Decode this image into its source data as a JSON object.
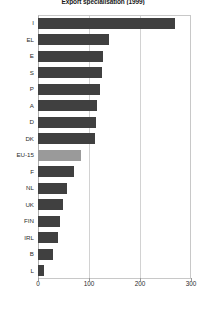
{
  "chart_data": {
    "type": "bar",
    "orientation": "horizontal",
    "title": "Export specialisation (1999)",
    "xlabel": "",
    "ylabel": "",
    "xlim": [
      0,
      300
    ],
    "xticks": [
      0,
      100,
      200,
      300
    ],
    "xtick_labels": [
      "0",
      "100",
      "200",
      "300"
    ],
    "grid": true,
    "grid_axis": "x",
    "legend": "none",
    "categories": [
      "I",
      "EL",
      "E",
      "S",
      "P",
      "A",
      "D",
      "DK",
      "EU-15",
      "F",
      "NL",
      "UK",
      "FIN",
      "IRL",
      "B",
      "L"
    ],
    "values": [
      268,
      140,
      128,
      126,
      122,
      116,
      114,
      112,
      85,
      70,
      57,
      49,
      44,
      39,
      29,
      12
    ],
    "series": [
      {
        "name": "Export specialisation",
        "values": [
          268,
          140,
          128,
          126,
          122,
          116,
          114,
          112,
          85,
          70,
          57,
          49,
          44,
          39,
          29,
          12
        ]
      }
    ],
    "highlight_category": "EU-15",
    "colors": {
      "bar": "#404040",
      "bar_highlight": "#9a9a9a",
      "grid": "#d2d2d2",
      "frame": "#c8c8c8",
      "text": "#2b2b2b",
      "title": "#1a1a1a",
      "background": "#ffffff"
    }
  }
}
